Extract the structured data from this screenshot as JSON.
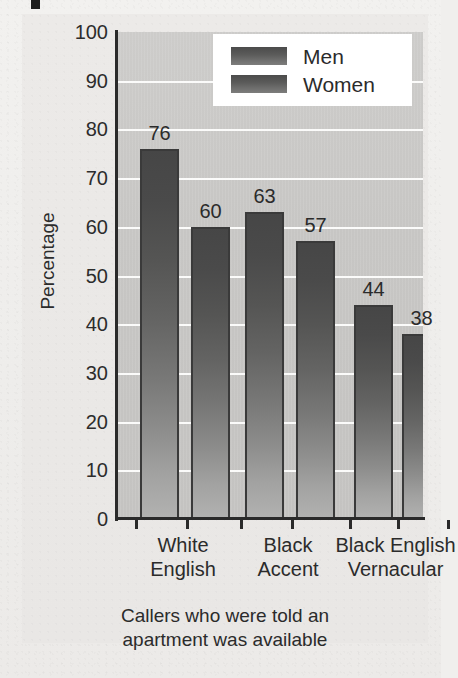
{
  "chart_data": {
    "type": "bar",
    "title": "",
    "subtitle": "",
    "caption_line1": "Callers who were told an",
    "caption_line2": "apartment was available",
    "categories": [
      "White English",
      "Black Accent",
      "Black English Vernacular"
    ],
    "category_lines": [
      [
        "White",
        "English"
      ],
      [
        "Black",
        "Accent"
      ],
      [
        "Black English",
        "Vernacular"
      ]
    ],
    "series": [
      {
        "name": "Men",
        "values": [
          76,
          63,
          44
        ]
      },
      {
        "name": "Women",
        "values": [
          60,
          57,
          38
        ]
      }
    ],
    "bars": [
      {
        "label": "76",
        "value": 76,
        "series": "Men",
        "category": "White English"
      },
      {
        "label": "60",
        "value": 60,
        "series": "Women",
        "category": "White English"
      },
      {
        "label": "63",
        "value": 63,
        "series": "Men",
        "category": "Black Accent"
      },
      {
        "label": "57",
        "value": 57,
        "series": "Women",
        "category": "Black Accent"
      },
      {
        "label": "44",
        "value": 44,
        "series": "Men",
        "category": "Black English Vernacular"
      },
      {
        "label": "38",
        "value": 38,
        "series": "Women",
        "category": "Black English Vernacular"
      }
    ],
    "xlabel": "",
    "ylabel": "Percentage",
    "ylim": [
      0,
      100
    ],
    "ytick_step": 10,
    "yticks": [
      "100",
      "90",
      "80",
      "70",
      "60",
      "50",
      "40",
      "30",
      "20",
      "10",
      "0"
    ],
    "grid": true,
    "grid_orientation": "horizontal",
    "grid_color": "#fbfbfa",
    "legend_position": "top-right",
    "plot_background": "#c8c7c5",
    "bar_color_top": "#464646",
    "bar_color_bottom": "#b2b2b1",
    "axis_color": "#2a2a2a",
    "text_color": "#2b2b2b"
  },
  "legend": {
    "entries": [
      {
        "label": "Men"
      },
      {
        "label": "Women"
      }
    ]
  }
}
